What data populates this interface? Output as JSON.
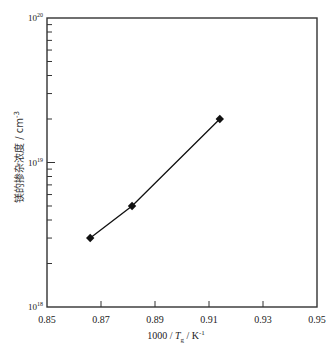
{
  "chart_data": {
    "type": "line",
    "title": "",
    "xlabel": "1000 / Tg / K⁻¹",
    "xlabel_parts": {
      "prefix": "1000 / ",
      "var": "T",
      "sub": "g",
      "unit": " / K",
      "sup": "-1"
    },
    "ylabel": "镁的掺杂浓度 / cm⁻³",
    "ylabel_parts": {
      "text": "镁的掺杂浓度 / cm",
      "sup": "-3"
    },
    "xlim": [
      0.85,
      0.95
    ],
    "ylim": [
      1e+18,
      1e+20
    ],
    "yscale": "log",
    "x_ticks": [
      "0.85",
      "0.87",
      "0.89",
      "0.91",
      "0.93",
      "0.95"
    ],
    "y_ticks": [
      {
        "base": "10",
        "exp": "18"
      },
      {
        "base": "10",
        "exp": "19"
      },
      {
        "base": "10",
        "exp": "20"
      }
    ],
    "grid": false,
    "legend": null,
    "series": [
      {
        "name": "Mg doping concentration",
        "marker": "diamond",
        "color": "#111111",
        "x": [
          0.866,
          0.8815,
          0.914
        ],
        "y": [
          3e+18,
          5e+18,
          2e+19
        ]
      }
    ]
  }
}
